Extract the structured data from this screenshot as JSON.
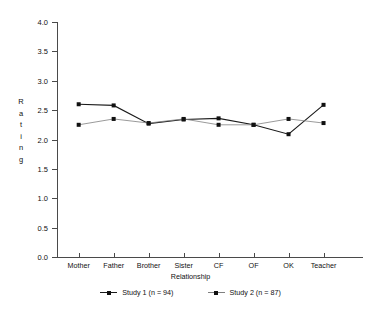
{
  "chart_data": {
    "type": "line",
    "title": "",
    "xlabel": "Relationship",
    "ylabel": "Rating",
    "categories": [
      "Mother",
      "Father",
      "Brother",
      "Sister",
      "CF",
      "OF",
      "OK",
      "Teacher"
    ],
    "ylim": [
      0.0,
      4.0
    ],
    "ytick_labels": [
      "0.0",
      "0.5",
      "1.0",
      "1.5",
      "2.0",
      "2.5",
      "3.0",
      "3.5",
      "4.0"
    ],
    "ytick_values": [
      0.0,
      0.5,
      1.0,
      1.5,
      2.0,
      2.5,
      3.0,
      3.5,
      4.0
    ],
    "grid": false,
    "legend_position": "bottom",
    "series": [
      {
        "name": "Study 1 (n = 94)",
        "color": "#1a1a1a",
        "marker": "square",
        "values": [
          2.6,
          2.58,
          2.27,
          2.34,
          2.36,
          2.25,
          2.09,
          2.59
        ]
      },
      {
        "name": "Study 2 (n = 87)",
        "color": "#808080",
        "marker": "square",
        "values": [
          2.25,
          2.35,
          2.28,
          2.35,
          2.25,
          2.25,
          2.35,
          2.28
        ]
      }
    ]
  },
  "ylabel_letters": [
    "R",
    "a",
    "t",
    "i",
    "n",
    "g"
  ]
}
